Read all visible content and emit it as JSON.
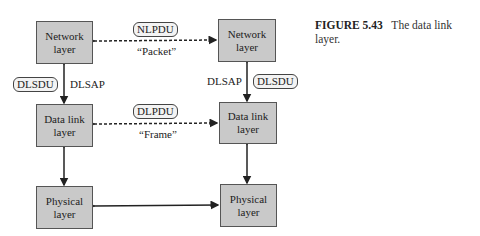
{
  "caption": {
    "figure_label": "FIGURE 5.43",
    "text": "The data link layer."
  },
  "left_stack": {
    "network": "Network layer",
    "data_link": "Data link layer",
    "physical": "Physical layer",
    "sdu_pill": "DLSDU",
    "sap_label": "DLSAP"
  },
  "right_stack": {
    "network": "Network layer",
    "data_link": "Data link layer",
    "physical": "Physical layer",
    "sdu_pill": "DLSDU",
    "sap_label": "DLSAP"
  },
  "peer_links": {
    "network": {
      "pdu": "NLPDU",
      "name": "“Packet”"
    },
    "data_link": {
      "pdu": "DLPDU",
      "name": "“Frame”"
    }
  },
  "colors": {
    "box_fill": "#c9c9c9",
    "line": "#222222"
  }
}
